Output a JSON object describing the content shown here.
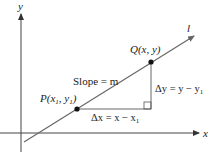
{
  "diagram": {
    "axes": {
      "x_label": "x",
      "y_label": "y"
    },
    "line": {
      "label": "l"
    },
    "points": {
      "P": {
        "name": "P",
        "label_text": "P(x",
        "sub1": "1",
        "mid": ", y",
        "sub2": "1",
        "end": ")"
      },
      "Q": {
        "name": "Q",
        "label_text": "Q(x, y)"
      }
    },
    "slope_label": "Slope = m",
    "delta_x": {
      "prefix": "Δx = x − x",
      "sub": "1"
    },
    "delta_y": {
      "prefix": "Δy = y − y",
      "sub": "1"
    },
    "colors": {
      "axis": "#444444",
      "line": "#6a6a6a",
      "point": "#111111",
      "text": "#222222"
    }
  }
}
